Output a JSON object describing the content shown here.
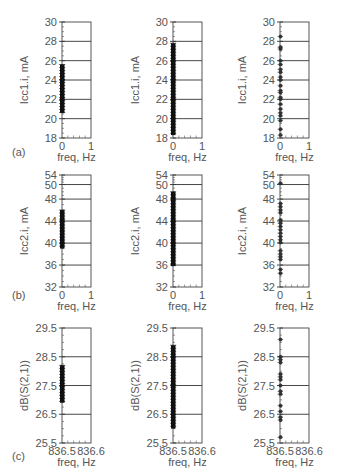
{
  "figure": {
    "rows": [
      "(a)",
      "(b)",
      "(c)"
    ]
  },
  "chart_data": [
    {
      "type": "scatter",
      "panel": "(a) left",
      "xlabel": "freq, Hz",
      "ylabel": "Icc1.i, mA",
      "xlim": [
        0,
        1
      ],
      "ylim": [
        18,
        30
      ],
      "xticks": [
        "0",
        "1"
      ],
      "yticks": [
        18,
        20,
        22,
        24,
        26,
        28,
        30
      ],
      "grid": "horizontal",
      "x": 0,
      "range": [
        20.6,
        25.6
      ],
      "style": "dense"
    },
    {
      "type": "scatter",
      "panel": "(a) middle",
      "xlabel": "freq, Hz",
      "ylabel": "Icc1.i, mA",
      "xlim": [
        0,
        1
      ],
      "ylim": [
        18,
        30
      ],
      "xticks": [
        "0",
        "1"
      ],
      "yticks": [
        18,
        20,
        22,
        24,
        26,
        28,
        30
      ],
      "grid": "horizontal",
      "x": 0,
      "range": [
        18.3,
        27.8
      ],
      "style": "dense"
    },
    {
      "type": "scatter",
      "panel": "(a) right",
      "xlabel": "freq, Hz",
      "ylabel": "Icc1.i, mA",
      "xlim": [
        0,
        1
      ],
      "ylim": [
        18,
        30
      ],
      "xticks": [
        "0",
        "1"
      ],
      "yticks": [
        18,
        20,
        22,
        24,
        26,
        28,
        30
      ],
      "grid": "horizontal",
      "x": 0,
      "values": [
        18.3,
        18.9,
        19.8,
        20.3,
        20.6,
        21.0,
        21.5,
        22.0,
        22.2,
        22.7,
        22.9,
        23.4,
        24.0,
        24.3,
        24.8,
        25.1,
        25.6,
        26.0,
        27.2,
        27.4,
        28.5
      ],
      "style": "sparse"
    },
    {
      "type": "scatter",
      "panel": "(b) left",
      "xlabel": "freq, Hz",
      "ylabel": "Icc2.i, mA",
      "xlim": [
        0,
        1
      ],
      "ylim": [
        32,
        54
      ],
      "xticks": [
        "0",
        "1"
      ],
      "ytick_labels": [
        "32",
        "36",
        "40",
        "44",
        "48",
        "50",
        "54"
      ],
      "grid": "horizontal",
      "x": 0,
      "range": [
        39.0,
        46.0
      ],
      "style": "dense"
    },
    {
      "type": "scatter",
      "panel": "(b) middle",
      "xlabel": "freq, Hz",
      "ylabel": "Icc2.i, mA",
      "xlim": [
        0,
        1
      ],
      "ylim": [
        32,
        54
      ],
      "xticks": [
        "0",
        "1"
      ],
      "ytick_labels": [
        "32",
        "36",
        "40",
        "44",
        "48",
        "50",
        "54"
      ],
      "grid": "horizontal",
      "x": 0,
      "range": [
        35.8,
        49.0
      ],
      "style": "dense"
    },
    {
      "type": "scatter",
      "panel": "(b) right",
      "xlabel": "freq, Hz",
      "ylabel": "Icc2.i, mA",
      "xlim": [
        0,
        1
      ],
      "ylim": [
        32,
        54
      ],
      "xticks": [
        "0",
        "1"
      ],
      "ytick_labels": [
        "32",
        "36",
        "40",
        "44",
        "48",
        "50",
        "54"
      ],
      "grid": "horizontal",
      "x": 0,
      "values": [
        34.5,
        35.2,
        37.0,
        37.5,
        38.0,
        38.6,
        40.1,
        40.6,
        41.2,
        41.8,
        42.4,
        43.0,
        43.6,
        44.2,
        45.5,
        46.0,
        46.6,
        47.2,
        50.5
      ],
      "style": "sparse"
    },
    {
      "type": "scatter",
      "panel": "(c) left",
      "xlabel": "freq, Hz",
      "ylabel": "dB(S(2,1))",
      "xlim": [
        836.5,
        836.6
      ],
      "ylim": [
        25.5,
        29.5
      ],
      "xticks": [
        "836.5",
        "836.6"
      ],
      "yticks": [
        25.5,
        26.5,
        27.5,
        28.5,
        29.5
      ],
      "grid": "horizontal",
      "x": 836.5,
      "range": [
        26.9,
        28.2
      ],
      "style": "dense"
    },
    {
      "type": "scatter",
      "panel": "(c) middle",
      "xlabel": "freq, Hz",
      "ylabel": "dB(S(2,1))",
      "xlim": [
        836.5,
        836.6
      ],
      "ylim": [
        25.5,
        29.5
      ],
      "xticks": [
        "836.5",
        "836.6"
      ],
      "yticks": [
        25.5,
        26.5,
        27.5,
        28.5,
        29.5
      ],
      "grid": "horizontal",
      "x": 836.5,
      "range": [
        26.0,
        28.9
      ],
      "style": "dense"
    },
    {
      "type": "scatter",
      "panel": "(c) right",
      "xlabel": "freq, Hz",
      "ylabel": "dB(S(2,1))",
      "xlim": [
        836.5,
        836.6
      ],
      "ylim": [
        25.5,
        29.5
      ],
      "xticks": [
        "836.5",
        "836.6"
      ],
      "yticks": [
        25.5,
        26.5,
        27.5,
        28.5,
        29.5
      ],
      "grid": "horizontal",
      "x": 836.5,
      "values": [
        25.7,
        26.3,
        26.4,
        26.6,
        26.8,
        27.2,
        27.3,
        27.5,
        27.7,
        27.8,
        27.9,
        28.3,
        28.4,
        28.5,
        29.1
      ],
      "style": "sparse"
    }
  ]
}
